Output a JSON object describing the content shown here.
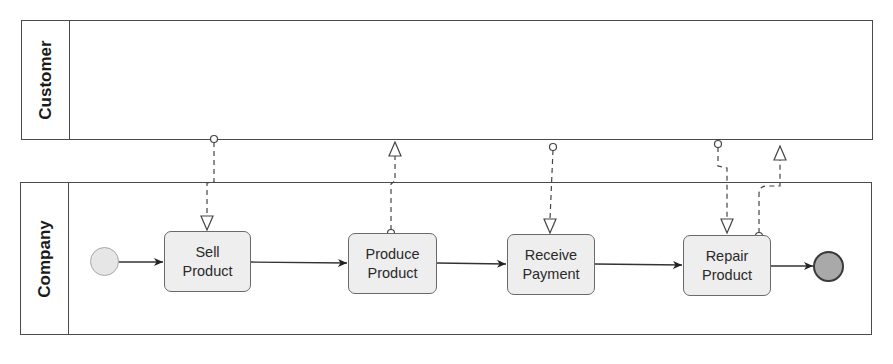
{
  "diagram": {
    "type": "BPMN collaboration",
    "pools": [
      {
        "id": "customer",
        "label": "Customer"
      },
      {
        "id": "company",
        "label": "Company"
      }
    ],
    "start_event": {
      "label": ""
    },
    "end_event": {
      "label": ""
    },
    "tasks": [
      {
        "id": "sell",
        "line1": "Sell",
        "line2": "Product"
      },
      {
        "id": "produce",
        "line1": "Produce",
        "line2": "Product"
      },
      {
        "id": "receive",
        "line1": "Receive",
        "line2": "Payment"
      },
      {
        "id": "repair",
        "line1": "Repair",
        "line2": "Product"
      }
    ],
    "sequence_flows": [
      {
        "from": "start",
        "to": "sell"
      },
      {
        "from": "sell",
        "to": "produce"
      },
      {
        "from": "produce",
        "to": "receive"
      },
      {
        "from": "receive",
        "to": "repair"
      },
      {
        "from": "repair",
        "to": "end"
      }
    ],
    "message_flows": [
      {
        "from": "customer",
        "to": "sell"
      },
      {
        "from": "produce",
        "to": "customer"
      },
      {
        "from": "customer",
        "to": "receive"
      },
      {
        "from": "customer",
        "to": "repair"
      },
      {
        "from": "repair",
        "to": "customer"
      }
    ],
    "colors": {
      "line": "#333333",
      "task_fill": "#eeeeee",
      "task_border": "#6a6a6a",
      "start_fill": "#e6e6e6",
      "end_fill": "#a9a9a9",
      "end_border": "#3a3a3a"
    }
  }
}
